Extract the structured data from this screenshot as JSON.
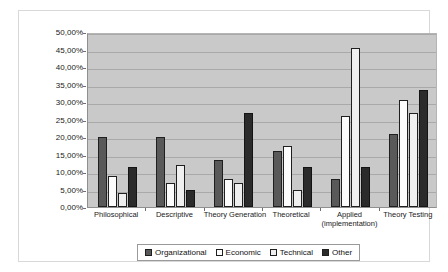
{
  "chart_data": {
    "type": "bar",
    "title": "",
    "subtitle": "",
    "xlabel": "",
    "ylabel": "",
    "ylim": [
      0,
      50
    ],
    "ytick_labels": [
      "50,00%",
      "45,00%",
      "40,00%",
      "35,00%",
      "30,00%",
      "25,00%",
      "20,00%",
      "15,00%",
      "10,00%",
      "5,00%",
      "0,00%"
    ],
    "ytick_values": [
      50,
      45,
      40,
      35,
      30,
      25,
      20,
      15,
      10,
      5,
      0
    ],
    "grid": true,
    "legend_position": "bottom",
    "categories": [
      "Philosophical",
      "Descriptive",
      "Theory Generation",
      "Theoretical",
      "Applied (implementation)",
      "Theory Testing"
    ],
    "category_lines": [
      [
        "Philosophical"
      ],
      [
        "Descriptive"
      ],
      [
        "Theory Generation"
      ],
      [
        "Theoretical"
      ],
      [
        "Applied",
        "(implementation)"
      ],
      [
        "Theory Testing"
      ]
    ],
    "series": [
      {
        "name": "Organizational",
        "color": "#595959",
        "values": [
          20.0,
          20.0,
          13.5,
          16.0,
          8.0,
          21.0
        ]
      },
      {
        "name": "Economic",
        "color": "#fcfcfc",
        "values": [
          9.0,
          7.0,
          8.0,
          17.5,
          26.0,
          30.5
        ]
      },
      {
        "name": "Technical",
        "color": "#efefef",
        "values": [
          4.0,
          12.0,
          7.0,
          5.0,
          45.5,
          27.0
        ]
      },
      {
        "name": "Other",
        "color": "#2b2b2b",
        "values": [
          11.5,
          5.0,
          27.0,
          11.5,
          11.5,
          33.5
        ]
      }
    ]
  },
  "legend": {
    "entries": [
      {
        "label": "Organizational",
        "swatch": "filled-dark"
      },
      {
        "label": "Economic",
        "swatch": "empty-white"
      },
      {
        "label": "Technical",
        "swatch": "empty-light"
      },
      {
        "label": "Other",
        "swatch": "filled-black"
      }
    ]
  },
  "colors": {
    "plot_background": "#c9c9c9",
    "gridline": "#a9a9a9",
    "axis": "#8f8f8f",
    "frame": "#d8d8d8",
    "text": "#1a1a1a"
  }
}
